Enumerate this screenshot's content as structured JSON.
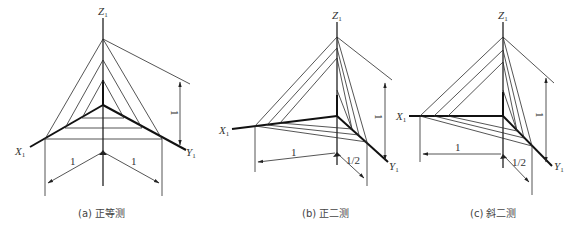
{
  "figure": {
    "panels": [
      {
        "id": "a",
        "caption": "(a) 正等测",
        "axes": {
          "x": "X",
          "y": "Y",
          "z": "Z",
          "subscript": "1"
        },
        "dimensions": {
          "x_scale": "1",
          "y_scale": "1",
          "z_scale": "1"
        }
      },
      {
        "id": "b",
        "caption": "(b) 正二测",
        "axes": {
          "x": "X",
          "y": "Y",
          "z": "Z",
          "subscript": "1"
        },
        "dimensions": {
          "x_scale": "1",
          "y_scale": "1/2",
          "z_scale": "1"
        }
      },
      {
        "id": "c",
        "caption": "(c) 斜二测",
        "axes": {
          "x": "X",
          "y": "Y",
          "z": "Z",
          "subscript": "1"
        },
        "dimensions": {
          "x_scale": "1",
          "y_scale": "1/2",
          "z_scale": "1"
        }
      }
    ]
  }
}
